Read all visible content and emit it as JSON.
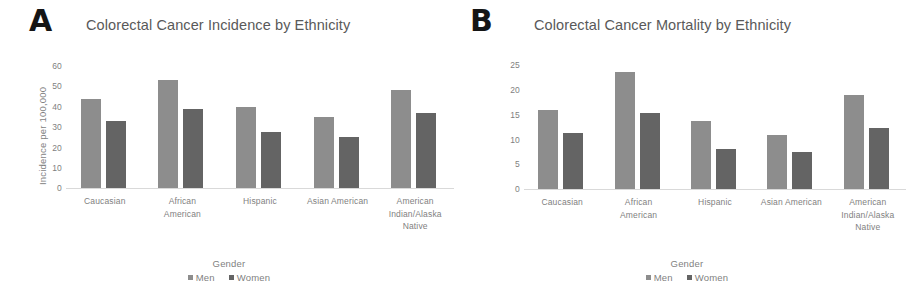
{
  "figure": {
    "background": "#ffffff",
    "colors": {
      "men": "#8d8d8d",
      "women": "#646464",
      "text": "#7f7f7f",
      "title": "#595959",
      "baseline": "#d9d9d9"
    }
  },
  "panels": [
    {
      "letter": "A",
      "title": "Colorectal Cancer Incidence by Ethnicity",
      "ylabel": "Incidence per 100,000",
      "yticks": [
        "60",
        "50",
        "40",
        "30",
        "20",
        "10",
        "0"
      ],
      "legend": {
        "title": "Gender",
        "men": "Men",
        "women": "Women"
      },
      "categories": [
        "Caucasian",
        "African\nAmerican",
        "Hispanic",
        "Asian American",
        "American\nIndian/Alaska\nNative"
      ]
    },
    {
      "letter": "B",
      "title": "Colorectal Cancer Mortality by Ethnicity",
      "ylabel": "Deaths per 100,000",
      "yticks": [
        "25",
        "20",
        "15",
        "10",
        "5",
        "0"
      ],
      "legend": {
        "title": "Gender",
        "men": "Men",
        "women": "Women"
      },
      "categories": [
        "Caucasian",
        "African\nAmerican",
        "Hispanic",
        "Asian American",
        "American\nIndian/Alaska\nNative"
      ]
    }
  ],
  "chart_data": [
    {
      "type": "bar",
      "title": "Colorectal Cancer Incidence by Ethnicity",
      "panel": "A",
      "xlabel": "Gender",
      "ylabel": "Incidence per 100,000",
      "ylim": [
        0,
        60
      ],
      "ytick_step": 10,
      "grid": false,
      "legend_position": "bottom",
      "categories": [
        "Caucasian",
        "African American",
        "Hispanic",
        "Asian American",
        "American Indian/Alaska Native"
      ],
      "series": [
        {
          "name": "Men",
          "color": "#8d8d8d",
          "values": [
            44,
            53,
            40,
            35,
            48
          ]
        },
        {
          "name": "Women",
          "color": "#646464",
          "values": [
            33,
            39,
            27.5,
            25,
            37
          ]
        }
      ]
    },
    {
      "type": "bar",
      "title": "Colorectal Cancer Mortality by Ethnicity",
      "panel": "B",
      "xlabel": "Gender",
      "ylabel": "Deaths per 100,000",
      "ylim": [
        0,
        25
      ],
      "ytick_step": 5,
      "grid": false,
      "legend_position": "bottom",
      "categories": [
        "Caucasian",
        "African American",
        "Hispanic",
        "Asian American",
        "American Indian/Alaska Native"
      ],
      "series": [
        {
          "name": "Men",
          "color": "#8d8d8d",
          "values": [
            16,
            23.6,
            13.7,
            10.8,
            18.9
          ]
        },
        {
          "name": "Women",
          "color": "#646464",
          "values": [
            11.3,
            15.3,
            8.1,
            7.4,
            12.4
          ]
        }
      ]
    }
  ]
}
